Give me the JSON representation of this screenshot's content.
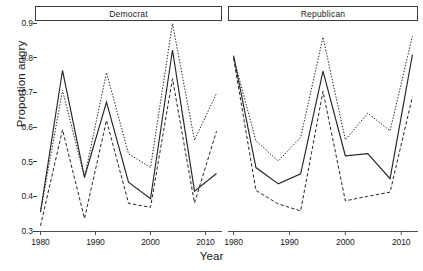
{
  "chart_data": {
    "type": "line",
    "title": "",
    "xlabel": "Year",
    "ylabel": "Proportion angry",
    "xlim": [
      1979,
      2013
    ],
    "ylim": [
      0.3,
      0.9
    ],
    "grid": false,
    "legend": "none",
    "xticks": [
      1980,
      1990,
      2000,
      2010
    ],
    "xtick_labels": [
      "1980",
      "1990",
      "2000",
      "2010"
    ],
    "yticks": [
      0.3,
      0.4,
      0.5,
      0.6,
      0.7,
      0.8,
      0.9
    ],
    "ytick_labels": [
      "0.3",
      "0.4",
      "0.5",
      "0.6",
      "0.7",
      "0.8",
      "0.9"
    ],
    "panel_layout": "1 row x 2 columns",
    "panels": [
      {
        "strip_label": "Democrat",
        "x": [
          1980,
          1984,
          1988,
          1992,
          1996,
          2000,
          2004,
          2008,
          2012
        ],
        "series": [
          {
            "name": "estimate",
            "style": "solid",
            "values": [
              0.355,
              0.763,
              0.455,
              0.672,
              0.441,
              0.393,
              0.822,
              0.415,
              0.466
            ]
          },
          {
            "name": "upper bound",
            "style": "dotted",
            "values": [
              0.355,
              0.706,
              0.455,
              0.757,
              0.523,
              0.483,
              0.898,
              0.562,
              0.697
            ]
          },
          {
            "name": "lower bound",
            "style": "dashed",
            "values": [
              0.315,
              0.592,
              0.336,
              0.619,
              0.38,
              0.368,
              0.739,
              0.381,
              0.588
            ]
          }
        ]
      },
      {
        "strip_label": "Republican",
        "x": [
          1980,
          1984,
          1988,
          1992,
          1996,
          2000,
          2004,
          2008,
          2012
        ],
        "series": [
          {
            "name": "estimate",
            "style": "solid",
            "values": [
              0.806,
              0.483,
              0.436,
              0.465,
              0.761,
              0.517,
              0.523,
              0.451,
              0.809
            ]
          },
          {
            "name": "upper bound",
            "style": "dotted",
            "values": [
              0.8,
              0.56,
              0.502,
              0.57,
              0.859,
              0.563,
              0.64,
              0.589,
              0.862
            ]
          },
          {
            "name": "lower bound",
            "style": "dashed",
            "values": [
              0.798,
              0.417,
              0.378,
              0.358,
              0.703,
              0.387,
              0.4,
              0.412,
              0.687
            ]
          }
        ]
      }
    ]
  },
  "axes": {
    "y_label": "Proportion angry",
    "x_label": "Year"
  },
  "style": {
    "line_color": "#262626",
    "frame_color": "#3b3b3b",
    "background": "#ffffff"
  }
}
